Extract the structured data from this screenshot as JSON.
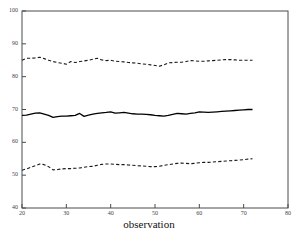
{
  "chart_data": {
    "type": "line",
    "title": "",
    "xlabel": "observation",
    "ylabel": "",
    "xlim": [
      20,
      80
    ],
    "ylim": [
      40,
      100
    ],
    "xticks": [
      20,
      30,
      40,
      50,
      60,
      70,
      80
    ],
    "yticks": [
      40,
      50,
      60,
      70,
      80,
      90,
      100
    ],
    "grid": false,
    "legend": "none",
    "x": [
      20,
      21,
      22,
      23,
      24,
      25,
      26,
      27,
      28,
      29,
      30,
      31,
      32,
      33,
      34,
      35,
      36,
      37,
      38,
      39,
      40,
      41,
      42,
      43,
      44,
      45,
      46,
      47,
      48,
      49,
      50,
      51,
      52,
      53,
      54,
      55,
      56,
      57,
      58,
      59,
      60,
      61,
      62,
      63,
      64,
      65,
      66,
      67,
      68,
      69,
      70,
      71,
      72
    ],
    "series": [
      {
        "name": "upper bound",
        "style": "dashed",
        "color": "#1a1a1a",
        "values": [
          85.0,
          85.6,
          85.6,
          85.7,
          85.9,
          85.5,
          85.0,
          84.6,
          84.3,
          84.1,
          83.8,
          84.6,
          84.3,
          84.6,
          84.8,
          85.0,
          85.3,
          85.6,
          85.1,
          84.9,
          85.0,
          84.7,
          84.6,
          84.5,
          84.3,
          84.2,
          84.1,
          83.9,
          83.8,
          83.6,
          83.4,
          83.2,
          83.6,
          84.2,
          84.3,
          84.4,
          84.4,
          84.6,
          84.9,
          84.8,
          84.7,
          84.7,
          84.8,
          84.9,
          85.0,
          85.1,
          85.2,
          85.2,
          85.1,
          85.0,
          85.0,
          85.0,
          85.0
        ]
      },
      {
        "name": "mean",
        "style": "solid",
        "color": "#000000",
        "values": [
          68.2,
          68.3,
          68.6,
          68.9,
          69.0,
          68.6,
          68.2,
          67.6,
          67.8,
          68.0,
          68.0,
          68.1,
          68.2,
          68.8,
          67.9,
          68.3,
          68.6,
          68.8,
          69.0,
          69.1,
          69.3,
          68.9,
          69.0,
          69.1,
          68.9,
          68.7,
          68.6,
          68.6,
          68.5,
          68.4,
          68.2,
          68.1,
          68.0,
          68.2,
          68.5,
          68.8,
          68.7,
          68.6,
          68.8,
          69.0,
          69.3,
          69.2,
          69.1,
          69.2,
          69.3,
          69.4,
          69.5,
          69.6,
          69.7,
          69.8,
          69.9,
          70.0,
          70.0
        ]
      },
      {
        "name": "lower bound",
        "style": "dashed",
        "color": "#1a1a1a",
        "values": [
          51.5,
          51.9,
          52.4,
          52.9,
          53.4,
          53.2,
          52.6,
          51.6,
          51.7,
          51.9,
          52.0,
          52.0,
          52.1,
          52.2,
          52.4,
          52.6,
          52.7,
          53.0,
          53.3,
          53.4,
          53.4,
          53.3,
          53.2,
          53.2,
          53.1,
          53.0,
          52.9,
          52.8,
          52.7,
          52.6,
          52.6,
          52.7,
          53.0,
          53.2,
          53.4,
          53.6,
          53.7,
          53.6,
          53.5,
          53.6,
          53.8,
          53.9,
          53.9,
          54.0,
          54.1,
          54.2,
          54.3,
          54.4,
          54.5,
          54.6,
          54.7,
          54.9,
          55.0
        ]
      }
    ]
  },
  "axis_title": "observation"
}
